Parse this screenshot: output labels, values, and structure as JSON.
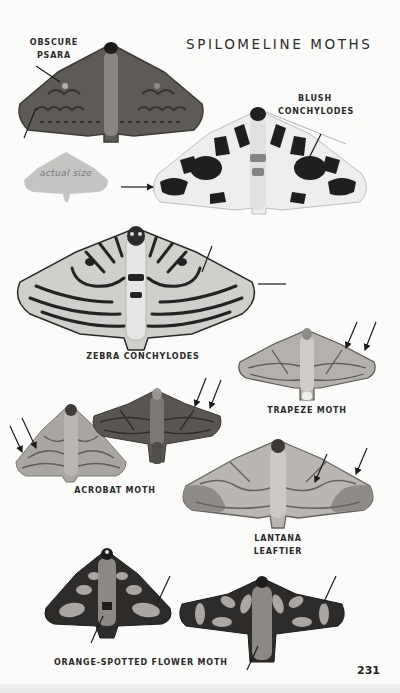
{
  "page": {
    "title": "SPILOMELINE MOTHS",
    "page_number": "231",
    "actual_size_label": "actual size"
  },
  "species": [
    {
      "id": "obscure-psara",
      "label_lines": [
        "OBSCURE",
        "PSARA"
      ],
      "palette": {
        "wing": "#5e5a57",
        "mark": "#2f2c2a",
        "body": "#8a8582"
      }
    },
    {
      "id": "blush-conchylodes",
      "label_lines": [
        "BLUSH",
        "CONCHYLODES"
      ],
      "palette": {
        "wing": "#ededeb",
        "mark": "#1f1f1f",
        "body": "#d8d6d3"
      }
    },
    {
      "id": "zebra-conchylodes",
      "label_lines": [
        "ZEBRA CONCHYLODES"
      ],
      "palette": {
        "wing": "#cfcfcc",
        "mark": "#232323",
        "body": "#e6e6e4"
      }
    },
    {
      "id": "trapeze-moth",
      "label_lines": [
        "TRAPEZE MOTH"
      ],
      "palette": {
        "wing": "#b3b0ad",
        "mark": "#5a5654",
        "body": "#cfccc9"
      }
    },
    {
      "id": "acrobat-moth",
      "label_lines": [
        "ACROBAT MOTH"
      ],
      "palette": {
        "wing": "#a8a5a2",
        "mark": "#5e5b58",
        "body": "#bab7b4",
        "wing2": "#595553"
      }
    },
    {
      "id": "lantana-leaftier",
      "label_lines": [
        "LANTANA",
        "LEAFTIER"
      ],
      "palette": {
        "wing": "#b9b6b3",
        "mark": "#66625f",
        "body": "#cbc8c5"
      }
    },
    {
      "id": "orange-spotted-flower-moth",
      "label_lines": [
        "ORANGE-SPOTTED FLOWER MOTH"
      ],
      "palette": {
        "wing": "#2e2c2b",
        "mark": "#a9a6a3",
        "body": "#8b8885"
      }
    }
  ],
  "colors": {
    "text": "#2a2a2a",
    "pointer": "#1c1c1c",
    "actual_size_shape": "#c4c4c2"
  }
}
